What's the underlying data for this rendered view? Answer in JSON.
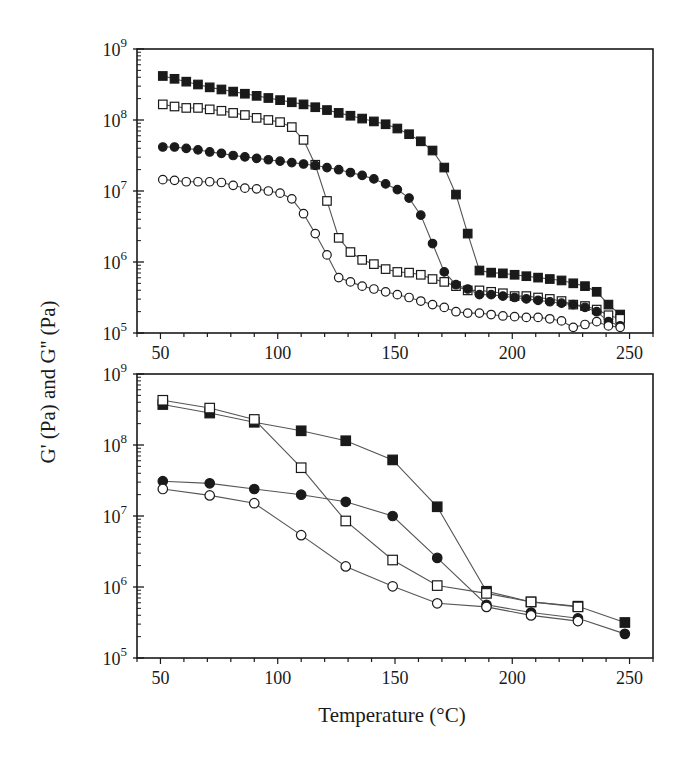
{
  "figure": {
    "ylabel": "G' (Pa) and G'' (Pa)",
    "xlabel": "Temperature (°C)"
  },
  "colors": {
    "axis": "#1a1a1a",
    "line": "#555555",
    "marker_fill": "#1a1a1a",
    "marker_open": "#ffffff"
  },
  "chart_data": [
    {
      "type": "line",
      "panel": "top",
      "title": "",
      "xlabel": "Temperature (°C)",
      "ylabel": "G' (Pa) and G'' (Pa)",
      "xlim": [
        40,
        260
      ],
      "ylim": [
        100000,
        1000000000
      ],
      "yscale": "log",
      "xticks": [
        50,
        100,
        150,
        200,
        250
      ],
      "yticks_labels": [
        "10^5",
        "10^6",
        "10^7",
        "10^8",
        "10^9"
      ],
      "grid": false,
      "legend": null,
      "x": [
        51,
        56,
        61,
        66,
        71,
        76,
        81,
        86,
        91,
        96,
        101,
        106,
        111,
        116,
        121,
        126,
        131,
        136,
        141,
        146,
        151,
        156,
        161,
        166,
        171,
        176,
        181,
        186,
        191,
        196,
        201,
        206,
        211,
        216,
        221,
        226,
        231,
        236,
        241,
        246
      ],
      "series": [
        {
          "name": "G' sample A (filled square)",
          "marker": "square-filled",
          "log10_values": [
            8.62,
            8.58,
            8.54,
            8.5,
            8.46,
            8.43,
            8.4,
            8.37,
            8.34,
            8.31,
            8.28,
            8.25,
            8.22,
            8.18,
            8.14,
            8.1,
            8.06,
            8.02,
            7.98,
            7.94,
            7.88,
            7.8,
            7.7,
            7.57,
            7.33,
            6.95,
            6.4,
            5.88,
            5.85,
            5.84,
            5.82,
            5.8,
            5.78,
            5.76,
            5.74,
            5.7,
            5.66,
            5.58,
            5.4,
            5.26
          ]
        },
        {
          "name": "G' sample B (open square)",
          "marker": "square-open",
          "log10_values": [
            8.22,
            8.19,
            8.17,
            8.17,
            8.15,
            8.13,
            8.1,
            8.07,
            8.03,
            8.0,
            7.97,
            7.9,
            7.72,
            7.37,
            6.86,
            6.34,
            6.14,
            6.03,
            5.97,
            5.9,
            5.86,
            5.85,
            5.82,
            5.76,
            5.72,
            5.66,
            5.6,
            5.6,
            5.58,
            5.56,
            5.52,
            5.52,
            5.5,
            5.48,
            5.45,
            5.4,
            5.38,
            5.33,
            5.25,
            5.2
          ]
        },
        {
          "name": "G'' sample A (filled circle)",
          "marker": "circle-filled",
          "log10_values": [
            7.62,
            7.62,
            7.6,
            7.58,
            7.55,
            7.53,
            7.5,
            7.48,
            7.46,
            7.44,
            7.42,
            7.4,
            7.38,
            7.36,
            7.33,
            7.3,
            7.26,
            7.22,
            7.17,
            7.1,
            7.02,
            6.9,
            6.66,
            6.26,
            5.86,
            5.68,
            5.62,
            5.54,
            5.54,
            5.52,
            5.5,
            5.48,
            5.46,
            5.44,
            5.42,
            5.4,
            5.36,
            5.3,
            5.16,
            5.1
          ]
        },
        {
          "name": "G'' sample B (open circle)",
          "marker": "circle-open",
          "log10_values": [
            7.16,
            7.15,
            7.13,
            7.13,
            7.13,
            7.12,
            7.08,
            7.04,
            7.03,
            7.0,
            6.97,
            6.89,
            6.68,
            6.4,
            6.1,
            5.78,
            5.72,
            5.66,
            5.62,
            5.58,
            5.54,
            5.5,
            5.45,
            5.4,
            5.36,
            5.3,
            5.28,
            5.28,
            5.26,
            5.24,
            5.23,
            5.22,
            5.22,
            5.2,
            5.17,
            5.08,
            5.12,
            5.16,
            5.1,
            5.08
          ]
        }
      ]
    },
    {
      "type": "line",
      "panel": "bottom",
      "title": "",
      "xlabel": "Temperature (°C)",
      "ylabel": "G' (Pa) and G'' (Pa)",
      "xlim": [
        40,
        260
      ],
      "ylim": [
        100000,
        1000000000
      ],
      "yscale": "log",
      "xticks": [
        50,
        100,
        150,
        200,
        250
      ],
      "yticks_labels": [
        "10^5",
        "10^6",
        "10^7",
        "10^8",
        "10^9"
      ],
      "grid": false,
      "legend": null,
      "x": [
        51,
        71,
        90,
        110,
        129,
        149,
        168,
        189,
        208,
        228,
        248
      ],
      "series": [
        {
          "name": "G' sample A (filled square)",
          "marker": "square-filled",
          "values": [
            370000000,
            280000000,
            210000000,
            160000000,
            115000000,
            62000000,
            13500000,
            880000,
            620000,
            540000,
            320000
          ],
          "log10_values": [
            8.57,
            8.45,
            8.32,
            8.2,
            8.06,
            7.79,
            7.13,
            5.94,
            5.79,
            5.73,
            5.5
          ]
        },
        {
          "name": "G' sample B (open square)",
          "marker": "square-open",
          "values": [
            430000000,
            330000000,
            230000000,
            48000000,
            8500000,
            2400000,
            1050000,
            820000,
            610000,
            520000,
            null
          ],
          "log10_values": [
            8.63,
            8.52,
            8.36,
            7.68,
            6.93,
            6.38,
            6.02,
            5.91,
            5.79,
            5.72,
            null
          ]
        },
        {
          "name": "G'' sample A (filled circle)",
          "marker": "circle-filled",
          "values": [
            31000000,
            29000000,
            24000000,
            20000000,
            16000000,
            10000000,
            2600000,
            560000,
            440000,
            360000,
            220000
          ],
          "log10_values": [
            7.49,
            7.46,
            7.38,
            7.3,
            7.2,
            7.0,
            6.41,
            5.75,
            5.64,
            5.56,
            5.34
          ]
        },
        {
          "name": "G'' sample B (open circle)",
          "marker": "circle-open",
          "values": [
            24000000,
            19500000,
            15000000,
            5400000,
            1950000,
            1020000,
            590000,
            520000,
            400000,
            330000,
            null
          ],
          "log10_values": [
            7.38,
            7.29,
            7.18,
            6.73,
            6.29,
            6.01,
            5.77,
            5.72,
            5.6,
            5.52,
            null
          ]
        }
      ]
    }
  ]
}
